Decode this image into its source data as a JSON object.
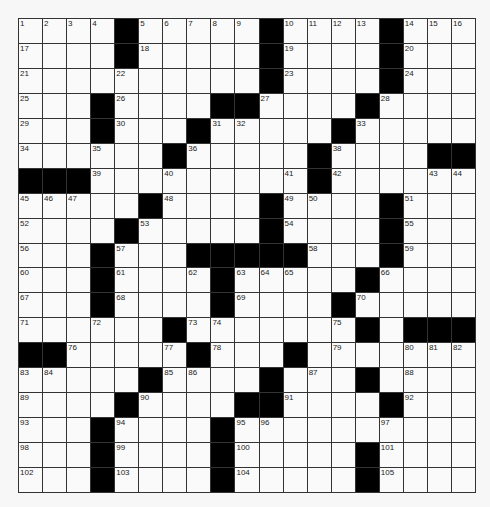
{
  "puzzle": {
    "rows": 19,
    "cols": 19,
    "colors": {
      "black": "#000000",
      "white": "#fafafa",
      "line": "#333333"
    },
    "grid": [
      "....#.....#....#...",
      "....#.....#....#...",
      "..........#....#...",
      "...#....##....#....",
      "...#...#.....#.....",
      "......#.....#....##",
      "###.........#......",
      ".....#....#....#...",
      "....#.....#....#...",
      "...#...#####...#...",
      "...#....#.....#....",
      "...#....#....#.....",
      "......#.......#.###",
      "##.....#...#.......",
      ".....#....#...#....",
      "....#....##....#...",
      "...#....#..........",
      "...#....#.....#....",
      "...#....#.....#...."
    ],
    "numbers": [
      {
        "r": 0,
        "c": 0,
        "n": "1"
      },
      {
        "r": 0,
        "c": 1,
        "n": "2"
      },
      {
        "r": 0,
        "c": 2,
        "n": "3"
      },
      {
        "r": 0,
        "c": 3,
        "n": "4"
      },
      {
        "r": 0,
        "c": 5,
        "n": "5"
      },
      {
        "r": 0,
        "c": 6,
        "n": "6"
      },
      {
        "r": 0,
        "c": 7,
        "n": "7"
      },
      {
        "r": 0,
        "c": 8,
        "n": "8"
      },
      {
        "r": 0,
        "c": 9,
        "n": "9"
      },
      {
        "r": 0,
        "c": 11,
        "n": "10"
      },
      {
        "r": 0,
        "c": 12,
        "n": "11"
      },
      {
        "r": 0,
        "c": 13,
        "n": "12"
      },
      {
        "r": 0,
        "c": 14,
        "n": "13"
      },
      {
        "r": 0,
        "c": 16,
        "n": "14"
      },
      {
        "r": 0,
        "c": 17,
        "n": "15"
      },
      {
        "r": 0,
        "c": 18,
        "n": "16"
      },
      {
        "r": 1,
        "c": 0,
        "n": "17"
      },
      {
        "r": 1,
        "c": 5,
        "n": "18"
      },
      {
        "r": 1,
        "c": 11,
        "n": "19"
      },
      {
        "r": 1,
        "c": 16,
        "n": "20"
      },
      {
        "r": 2,
        "c": 0,
        "n": "21"
      },
      {
        "r": 2,
        "c": 4,
        "n": "22"
      },
      {
        "r": 2,
        "c": 11,
        "n": "23"
      },
      {
        "r": 2,
        "c": 16,
        "n": "24"
      },
      {
        "r": 3,
        "c": 0,
        "n": "25"
      },
      {
        "r": 3,
        "c": 4,
        "n": "26"
      },
      {
        "r": 3,
        "c": 10,
        "n": "27"
      },
      {
        "r": 3,
        "c": 15,
        "n": "28"
      },
      {
        "r": 4,
        "c": 0,
        "n": "29"
      },
      {
        "r": 4,
        "c": 4,
        "n": "30"
      },
      {
        "r": 4,
        "c": 8,
        "n": "31"
      },
      {
        "r": 4,
        "c": 9,
        "n": "32"
      },
      {
        "r": 4,
        "c": 14,
        "n": "33"
      },
      {
        "r": 5,
        "c": 0,
        "n": "34"
      },
      {
        "r": 5,
        "c": 3,
        "n": "35"
      },
      {
        "r": 5,
        "c": 7,
        "n": "36"
      },
      {
        "r": 5,
        "c": 12,
        "n": "37"
      },
      {
        "r": 5,
        "c": 13,
        "n": "38"
      },
      {
        "r": 6,
        "c": 3,
        "n": "39"
      },
      {
        "r": 6,
        "c": 6,
        "n": "40"
      },
      {
        "r": 6,
        "c": 11,
        "n": "41"
      },
      {
        "r": 6,
        "c": 13,
        "n": "42"
      },
      {
        "r": 6,
        "c": 17,
        "n": "43"
      },
      {
        "r": 6,
        "c": 18,
        "n": "44"
      },
      {
        "r": 7,
        "c": 0,
        "n": "45"
      },
      {
        "r": 7,
        "c": 1,
        "n": "46"
      },
      {
        "r": 7,
        "c": 2,
        "n": "47"
      },
      {
        "r": 7,
        "c": 6,
        "n": "48"
      },
      {
        "r": 7,
        "c": 11,
        "n": "49"
      },
      {
        "r": 7,
        "c": 12,
        "n": "50"
      },
      {
        "r": 7,
        "c": 16,
        "n": "51"
      },
      {
        "r": 8,
        "c": 0,
        "n": "52"
      },
      {
        "r": 8,
        "c": 5,
        "n": "53"
      },
      {
        "r": 8,
        "c": 11,
        "n": "54"
      },
      {
        "r": 8,
        "c": 16,
        "n": "55"
      },
      {
        "r": 9,
        "c": 0,
        "n": "56"
      },
      {
        "r": 9,
        "c": 4,
        "n": "57"
      },
      {
        "r": 9,
        "c": 12,
        "n": "58"
      },
      {
        "r": 9,
        "c": 16,
        "n": "59"
      },
      {
        "r": 10,
        "c": 0,
        "n": "60"
      },
      {
        "r": 10,
        "c": 4,
        "n": "61"
      },
      {
        "r": 10,
        "c": 7,
        "n": "62"
      },
      {
        "r": 10,
        "c": 9,
        "n": "63"
      },
      {
        "r": 10,
        "c": 10,
        "n": "64"
      },
      {
        "r": 10,
        "c": 11,
        "n": "65"
      },
      {
        "r": 10,
        "c": 15,
        "n": "66"
      },
      {
        "r": 11,
        "c": 0,
        "n": "67"
      },
      {
        "r": 11,
        "c": 4,
        "n": "68"
      },
      {
        "r": 11,
        "c": 9,
        "n": "69"
      },
      {
        "r": 11,
        "c": 14,
        "n": "70"
      },
      {
        "r": 12,
        "c": 0,
        "n": "71"
      },
      {
        "r": 12,
        "c": 3,
        "n": "72"
      },
      {
        "r": 12,
        "c": 7,
        "n": "73"
      },
      {
        "r": 12,
        "c": 8,
        "n": "74"
      },
      {
        "r": 12,
        "c": 13,
        "n": "75"
      },
      {
        "r": 13,
        "c": 2,
        "n": "76"
      },
      {
        "r": 13,
        "c": 6,
        "n": "77"
      },
      {
        "r": 13,
        "c": 8,
        "n": "78"
      },
      {
        "r": 13,
        "c": 13,
        "n": "79"
      },
      {
        "r": 13,
        "c": 16,
        "n": "80"
      },
      {
        "r": 13,
        "c": 17,
        "n": "81"
      },
      {
        "r": 13,
        "c": 18,
        "n": "82"
      },
      {
        "r": 14,
        "c": 0,
        "n": "83"
      },
      {
        "r": 14,
        "c": 1,
        "n": "84"
      },
      {
        "r": 14,
        "c": 6,
        "n": "85"
      },
      {
        "r": 14,
        "c": 7,
        "n": "86"
      },
      {
        "r": 14,
        "c": 12,
        "n": "87"
      },
      {
        "r": 14,
        "c": 16,
        "n": "88"
      },
      {
        "r": 15,
        "c": 0,
        "n": "89"
      },
      {
        "r": 15,
        "c": 5,
        "n": "90"
      },
      {
        "r": 15,
        "c": 11,
        "n": "91"
      },
      {
        "r": 15,
        "c": 16,
        "n": "92"
      },
      {
        "r": 16,
        "c": 0,
        "n": "93"
      },
      {
        "r": 16,
        "c": 4,
        "n": "94"
      },
      {
        "r": 16,
        "c": 9,
        "n": "95"
      },
      {
        "r": 16,
        "c": 10,
        "n": "96"
      },
      {
        "r": 16,
        "c": 15,
        "n": "97"
      },
      {
        "r": 17,
        "c": 0,
        "n": "98"
      },
      {
        "r": 17,
        "c": 4,
        "n": "99"
      },
      {
        "r": 17,
        "c": 9,
        "n": "100"
      },
      {
        "r": 17,
        "c": 15,
        "n": "101"
      },
      {
        "r": 18,
        "c": 0,
        "n": "102"
      },
      {
        "r": 18,
        "c": 4,
        "n": "103"
      },
      {
        "r": 18,
        "c": 9,
        "n": "104"
      },
      {
        "r": 18,
        "c": 15,
        "n": "105"
      }
    ]
  }
}
